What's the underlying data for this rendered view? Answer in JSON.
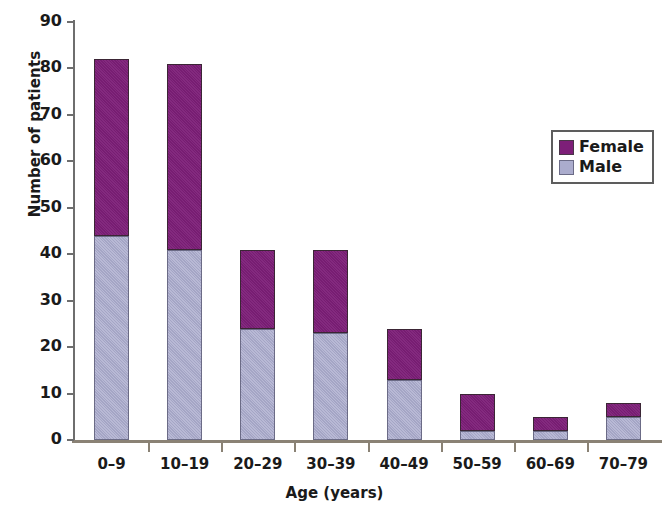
{
  "chart_data": {
    "type": "bar",
    "subtype": "stacked-vertical-bar",
    "title": "",
    "xlabel": "Age (years)",
    "ylabel": "Number of patients",
    "categories": [
      "0–9",
      "10–19",
      "20–29",
      "30–39",
      "40–49",
      "50–59",
      "60–69",
      "70–79"
    ],
    "series": [
      {
        "name": "Male",
        "color": "#abaccd",
        "values": [
          44,
          41,
          24,
          23,
          13,
          2,
          2,
          5
        ]
      },
      {
        "name": "Female",
        "color": "#7d1f78",
        "values": [
          38,
          40,
          17,
          18,
          11,
          8,
          3,
          3
        ]
      }
    ],
    "stack_order": [
      "Male",
      "Female"
    ],
    "totals": [
      82,
      81,
      41,
      41,
      24,
      10,
      5,
      8
    ],
    "ylim": [
      0,
      90
    ],
    "ytick_values": [
      0,
      10,
      20,
      30,
      40,
      50,
      60,
      70,
      80,
      90
    ],
    "ytick_labels": [
      "0",
      "10",
      "20",
      "30",
      "40",
      "50",
      "60",
      "70",
      "80",
      "90"
    ],
    "grid": false,
    "legend_position": "upper-right",
    "legend_entries": [
      "Female",
      "Male"
    ],
    "background_color": "#ffffff",
    "axis_color": "#8a8275"
  },
  "legend": {
    "items": [
      {
        "label": "Female",
        "swatch": "female"
      },
      {
        "label": "Male",
        "swatch": "male"
      }
    ]
  }
}
